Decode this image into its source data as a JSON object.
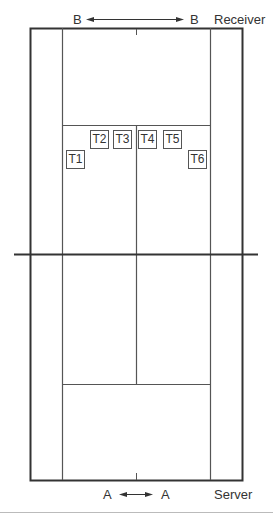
{
  "diagram": {
    "top_label": {
      "left": "B",
      "right": "B",
      "role": "Receiver"
    },
    "bottom_label": {
      "left": "A",
      "right": "A",
      "role": "Server"
    },
    "targets": [
      {
        "id": "T1",
        "x": 66,
        "y": 150
      },
      {
        "id": "T2",
        "x": 90,
        "y": 130
      },
      {
        "id": "T3",
        "x": 113,
        "y": 130
      },
      {
        "id": "T4",
        "x": 138,
        "y": 130
      },
      {
        "id": "T5",
        "x": 163,
        "y": 130
      },
      {
        "id": "T6",
        "x": 188,
        "y": 150
      }
    ],
    "colors": {
      "line": "#333333",
      "background": "#ffffff"
    }
  }
}
